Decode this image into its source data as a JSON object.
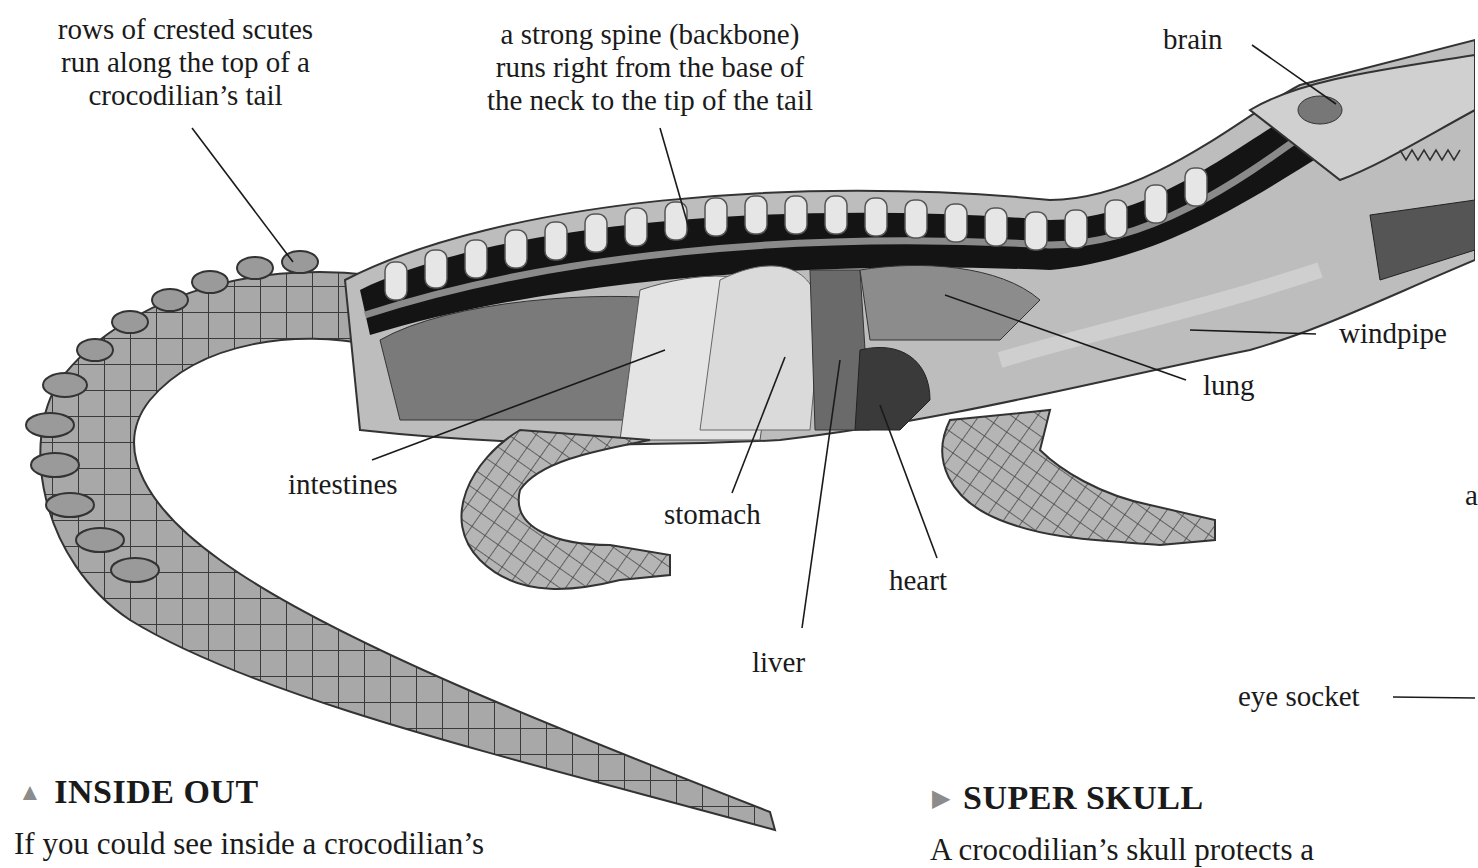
{
  "callouts": {
    "scutes": [
      "rows of crested scutes",
      "run along the top of a",
      "crocodilian’s tail"
    ],
    "spine": [
      "a strong spine (backbone)",
      "runs right from the base of",
      "the neck to the tip of the tail"
    ]
  },
  "labels": {
    "brain": "brain",
    "windpipe": "windpipe",
    "lung": "lung",
    "intestines": "intestines",
    "stomach": "stomach",
    "heart": "heart",
    "liver": "liver",
    "eye_socket": "eye socket",
    "cut_off_letter": "a"
  },
  "sections": [
    {
      "marker": "▲",
      "title": "INSIDE OUT",
      "text": "If you could see inside a crocodilian’s"
    },
    {
      "marker": "▶",
      "title": "SUPER SKULL",
      "text": "A crocodilian’s skull protects a"
    }
  ],
  "colors": {
    "marker": "#8c8c8c",
    "ink": "#1a1a1a",
    "spine_dark": "#141414",
    "vertebra": "#e6e6e6"
  }
}
